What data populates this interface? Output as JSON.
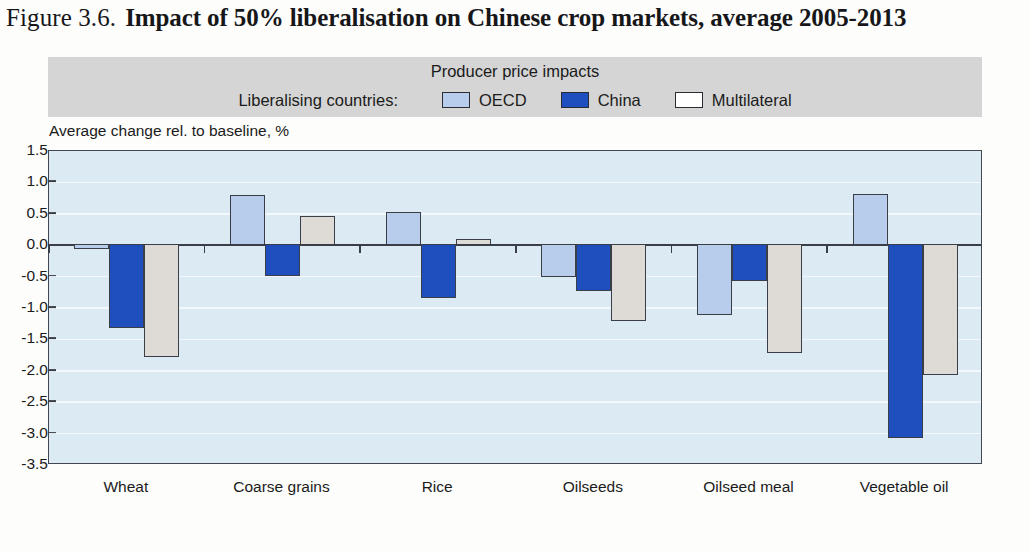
{
  "figure": {
    "number": "Figure 3.6.",
    "title": "Impact of 50% liberalisation on Chinese crop markets, average 2005-2013"
  },
  "legend": {
    "title": "Producer price impacts",
    "prefix": "Liberalising countries:",
    "items": [
      {
        "label": "OECD",
        "color": "#b8cdec"
      },
      {
        "label": "China",
        "color": "#1f4fbe"
      },
      {
        "label": "Multilateral",
        "color": "#dedbd6"
      }
    ]
  },
  "axis_caption": "Average change rel. to baseline, %",
  "colors": {
    "plot_background": "#dceaf4",
    "gridline": "#f2f8fc",
    "axis_line": "#3a3e47",
    "legend_band": "#d5d5d5",
    "oecd": "#b8cdec",
    "china": "#1f4fbe",
    "multilateral": "#dedbd6"
  },
  "chart_data": {
    "type": "bar",
    "title": "Impact of 50% liberalisation on Chinese crop markets, average 2005-2013",
    "subtitle": "Producer price impacts",
    "xlabel": "",
    "ylabel": "Average change rel. to baseline, %",
    "ylim": [
      -3.5,
      1.5
    ],
    "yticks": [
      1.5,
      1.0,
      0.5,
      0.0,
      -0.5,
      -1.0,
      -1.5,
      -2.0,
      -2.5,
      -3.0,
      -3.5
    ],
    "ytick_labels": [
      "1.5",
      "1.0",
      "0.5",
      "0.0",
      "-0.5",
      "-1.0",
      "-1.5",
      "-2.0",
      "-2.5",
      "-3.0",
      "-3.5"
    ],
    "grid": true,
    "legend_position": "top",
    "categories": [
      "Wheat",
      "Coarse grains",
      "Rice",
      "Oilseeds",
      "Oilseed meal",
      "Vegetable oil"
    ],
    "series": [
      {
        "name": "OECD",
        "color": "#b8cdec",
        "values": [
          -0.07,
          0.8,
          0.53,
          -0.53,
          -1.12,
          0.82
        ]
      },
      {
        "name": "China",
        "color": "#1f4fbe",
        "values": [
          -1.33,
          -0.5,
          -0.85,
          -0.75,
          -0.58,
          -3.08
        ]
      },
      {
        "name": "Multilateral",
        "color": "#dedbd6",
        "values": [
          -1.8,
          0.47,
          0.1,
          -1.23,
          -1.73,
          -2.08
        ]
      }
    ]
  }
}
